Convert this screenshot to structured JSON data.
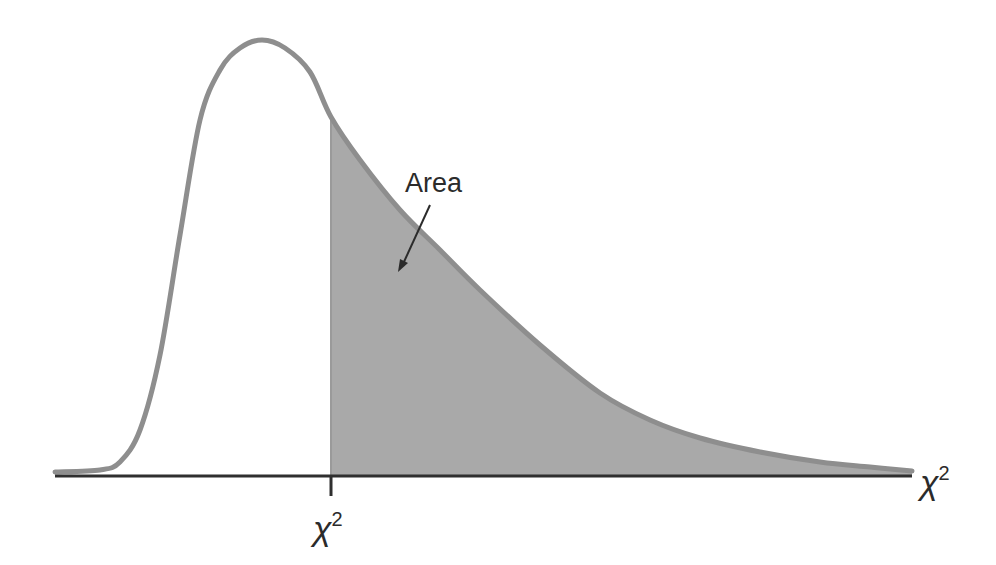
{
  "chart_data": {
    "type": "area",
    "title": "",
    "subtitle": "",
    "xlabel": "χ²",
    "ylabel": "",
    "grid": false,
    "legend": null,
    "x_tick_labels": [
      "χ²"
    ],
    "critical_value_label": "χ²",
    "annotations": [
      {
        "text": "Area",
        "points_to": "shaded right-tail region"
      }
    ],
    "series": [
      {
        "name": "density",
        "x_px": [
          55,
          100,
          120,
          140,
          160,
          180,
          200,
          220,
          240,
          262,
          285,
          310,
          331,
          360,
          400,
          440,
          480,
          540,
          600,
          650,
          700,
          760,
          820,
          870,
          912
        ],
        "y_px": [
          472,
          470,
          462,
          430,
          355,
          235,
          120,
          70,
          48,
          40,
          48,
          72,
          117,
          160,
          210,
          250,
          290,
          345,
          393,
          420,
          438,
          452,
          462,
          467,
          471
        ]
      }
    ],
    "shaded_region": {
      "from": "critical value",
      "to": "right tail",
      "fill": "#a9a9a9"
    },
    "colors": {
      "curve": "#8e8e8e",
      "shade": "#a9a9a9",
      "axis": "#2f2f2f",
      "text": "#2b2b2b"
    }
  },
  "labels": {
    "area": "Area",
    "axis_end": "χ",
    "axis_end_sup": "2",
    "tick": "χ",
    "tick_sup": "2"
  }
}
